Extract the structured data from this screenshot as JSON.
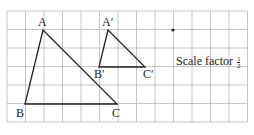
{
  "diagram": {
    "grid": {
      "cols": 13,
      "rows": 6,
      "left": 7,
      "top": 11,
      "cell": 18.5,
      "line_color": "#b8b8b8"
    },
    "triangles": [
      {
        "name": "ABC",
        "vertices": {
          "A": [
            43,
            30
          ],
          "B": [
            25,
            104
          ],
          "C": [
            117,
            104
          ]
        }
      },
      {
        "name": "A'B'C'",
        "vertices": {
          "A'": [
            108,
            30
          ],
          "B'": [
            99,
            67
          ],
          "C'": [
            145,
            67
          ]
        }
      }
    ],
    "centre_dot": [
      173,
      30
    ],
    "labels": {
      "A": "A",
      "B": "B",
      "C": "C",
      "A_prime": "A′",
      "B_prime": "B′",
      "C_prime": "C′"
    },
    "scale_factor": {
      "text": "Scale factor",
      "numerator": "1",
      "denominator": "2"
    }
  }
}
